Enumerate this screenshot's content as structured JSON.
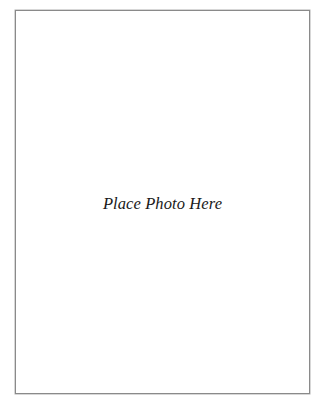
{
  "photo_placeholder": {
    "text": "Place Photo Here",
    "border_color": "#8a8a8a",
    "background_color": "#ffffff"
  }
}
